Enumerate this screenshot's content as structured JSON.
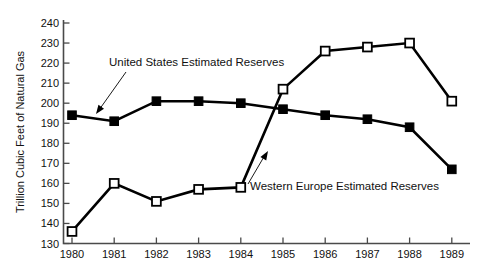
{
  "chart_data": {
    "type": "line",
    "title": "",
    "xlabel": "",
    "ylabel": "Trillion Cubic Feet of Natural Gas",
    "categories": [
      "1980",
      "1981",
      "1982",
      "1983",
      "1984",
      "1985",
      "1986",
      "1987",
      "1988",
      "1989"
    ],
    "xlim": [
      "1980",
      "1989"
    ],
    "ylim": [
      130,
      240
    ],
    "ytick_labels": [
      "240",
      "230",
      "220",
      "210",
      "200",
      "190",
      "180",
      "170",
      "160",
      "150",
      "140",
      "130"
    ],
    "ytick_values": [
      240,
      230,
      220,
      210,
      200,
      190,
      180,
      170,
      160,
      150,
      140,
      130
    ],
    "grid": false,
    "legend_position": "inline-annotations",
    "series": [
      {
        "name": "United States Estimated Reserves",
        "marker": "filled-square",
        "values": [
          194,
          191,
          201,
          201,
          200,
          197,
          194,
          192,
          188,
          167
        ]
      },
      {
        "name": "Western Europe Estimated Reserves",
        "marker": "open-square",
        "values": [
          136,
          160,
          151,
          157,
          158,
          207,
          226,
          228,
          230,
          201
        ]
      }
    ],
    "annotations": [
      {
        "text": "United States Estimated Reserves",
        "points_to_series": "United States Estimated Reserves",
        "points_to_category": "1981"
      },
      {
        "text": "Western Europe Estimated Reserves",
        "points_to_series": "Western Europe Estimated Reserves",
        "points_to_category": "1985"
      }
    ]
  }
}
